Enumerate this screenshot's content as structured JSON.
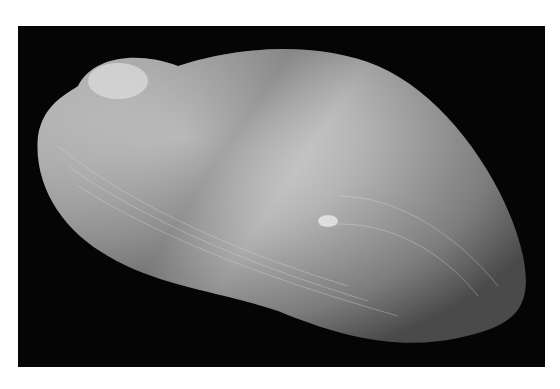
{
  "image": {
    "subject": "bivalve shell",
    "background_color": "#050505",
    "page_color": "#ffffff",
    "shell_colors": {
      "highlight": "#e8e8e8",
      "mid": "#9a9a9a",
      "shadow": "#4a4a4a"
    }
  }
}
